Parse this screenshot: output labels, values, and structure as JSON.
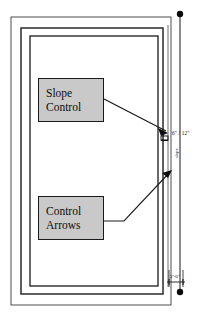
{
  "drawing": {
    "type": "architectural-roof-plan-detail",
    "background_color": "#ffffff",
    "line_color": "#1a1a1a",
    "fill_color": "#c9c9c9"
  },
  "callouts": [
    {
      "name": "slope-control",
      "line1": "Slope",
      "line2": "Control"
    },
    {
      "name": "control-arrows",
      "line1": "Control",
      "line2": "Arrows"
    }
  ],
  "annotations": {
    "slope_ratio": "6\" / 12\"",
    "slope_word": "slope",
    "bottom_dimension": "2'-6\""
  },
  "frames": {
    "outer": "outer-rectangle",
    "middle": "middle-rectangle",
    "inner": "inner-rectangle"
  },
  "markers": {
    "top_endpoint": "dimension-endpoint-dot",
    "bottom_endpoint": "dimension-endpoint-dot",
    "slope_symbol": "slope-control-symbol"
  }
}
